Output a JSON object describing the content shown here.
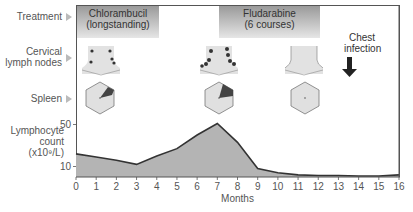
{
  "rows": {
    "treatment": "Treatment",
    "cervical_line1": "Cervical",
    "cervical_line2": "lymph nodes",
    "spleen": "Spleen",
    "lympho_line1": "Lymphocyte",
    "lympho_line2": "count",
    "lympho_line3": "(x10⁹/L)"
  },
  "treatments": [
    {
      "line1": "Chlorambucil",
      "line2": "(longstanding)",
      "start_month": 0,
      "end_month": 3
    },
    {
      "line1": "Fludarabine",
      "line2": "(6 courses)",
      "start_month": 7,
      "end_month": 12
    }
  ],
  "event": {
    "line1": "Chest",
    "line2": "infection",
    "month": 13.5,
    "icon": "down-arrow-icon"
  },
  "lymph_node_states": [
    {
      "month": 1,
      "state": "enlarged-small"
    },
    {
      "month": 7,
      "state": "enlarged-large"
    },
    {
      "month": 11,
      "state": "normal"
    }
  ],
  "spleen_states": [
    {
      "month": 1,
      "state": "mildly-enlarged"
    },
    {
      "month": 7,
      "state": "enlarged"
    },
    {
      "month": 11,
      "state": "normal"
    }
  ],
  "colors": {
    "area_fill": "#b4b4b4",
    "line": "#333333",
    "band_dark": "#9a9a9a",
    "band_light": "#e6e6e6"
  },
  "chart_data": {
    "type": "area",
    "title": "",
    "xlabel": "Months",
    "ylabel": "Lymphocyte count (x10⁹/L)",
    "x": [
      0,
      1,
      2,
      3,
      4,
      5,
      6,
      7,
      8,
      9,
      10,
      11,
      12,
      13,
      14,
      15,
      16
    ],
    "values": [
      22,
      19,
      16,
      12,
      20,
      27,
      40,
      51,
      33,
      8,
      4,
      2,
      1.5,
      1.5,
      1,
      1,
      2
    ],
    "y_ticks": [
      10,
      50
    ],
    "x_ticks": [
      "0",
      "1",
      "2",
      "3",
      "4",
      "5",
      "6",
      "7",
      "8",
      "9",
      "10",
      "11",
      "12",
      "13",
      "14",
      "15",
      "16"
    ],
    "xlim": [
      0,
      16
    ],
    "ylim": [
      0,
      55
    ],
    "grid": false,
    "legend": "none"
  }
}
